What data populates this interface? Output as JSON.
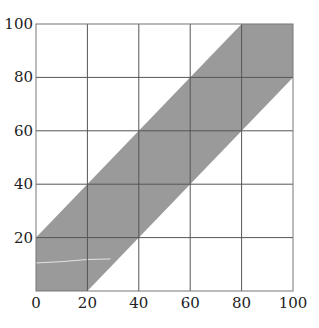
{
  "chart_data": {
    "type": "area",
    "title": "",
    "xlabel": "",
    "ylabel": "",
    "xlim": [
      0,
      100
    ],
    "ylim": [
      0,
      100
    ],
    "grid": true,
    "x_ticks": [
      0,
      20,
      40,
      60,
      80,
      100
    ],
    "y_ticks": [
      0,
      20,
      40,
      60,
      80,
      100
    ],
    "x_tick_labels": [
      "0",
      "20",
      "40",
      "60",
      "80",
      "100"
    ],
    "y_tick_labels": [
      "20",
      "40",
      "60",
      "80",
      "100"
    ],
    "series": [
      {
        "name": "band",
        "description": "shaded region between y = x - 20 and y = x + 20 clipped to [0,100]",
        "polygon": [
          [
            0,
            0
          ],
          [
            20,
            0
          ],
          [
            100,
            80
          ],
          [
            100,
            100
          ],
          [
            80,
            100
          ],
          [
            0,
            20
          ]
        ],
        "upper_edge": [
          [
            0,
            20
          ],
          [
            80,
            100
          ]
        ],
        "lower_edge": [
          [
            20,
            0
          ],
          [
            100,
            80
          ]
        ],
        "fill": "#9a9a9a"
      },
      {
        "name": "faint-line",
        "description": "faint light line inside band near bottom-left",
        "points": [
          [
            0,
            10.5
          ],
          [
            10,
            11
          ],
          [
            20,
            11.8
          ],
          [
            29,
            12
          ]
        ],
        "color": "#e4e4e4"
      }
    ],
    "colors": {
      "band": "#9a9a9a",
      "grid_outside": "#555555",
      "grid_inside": "#2a2a2a",
      "border": "#777777"
    }
  }
}
